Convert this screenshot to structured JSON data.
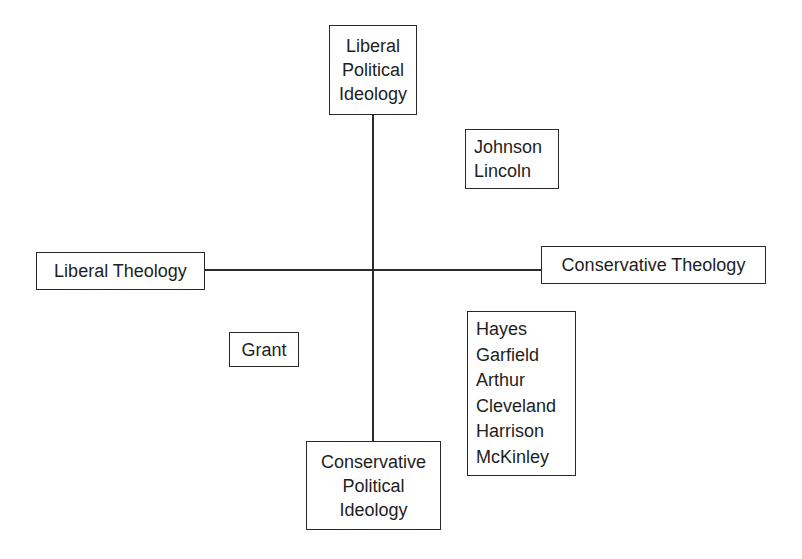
{
  "diagram": {
    "type": "quadrant",
    "axes": {
      "vertical": {
        "top_label": [
          "Liberal",
          "Political",
          "Ideology"
        ],
        "bottom_label": [
          "Conservative",
          "Political",
          "Ideology"
        ]
      },
      "horizontal": {
        "left_label": "Liberal Theology",
        "right_label": "Conservative Theology"
      }
    },
    "groups": {
      "upper_right": [
        "Johnson",
        "Lincoln"
      ],
      "lower_left": [
        "Grant"
      ],
      "lower_right": [
        "Hayes",
        "Garfield",
        "Arthur",
        "Cleveland",
        "Harrison",
        "McKinley"
      ]
    },
    "colors": {
      "line": "#2a2a2a",
      "text": "#1e1e1e",
      "background": "#ffffff"
    }
  }
}
